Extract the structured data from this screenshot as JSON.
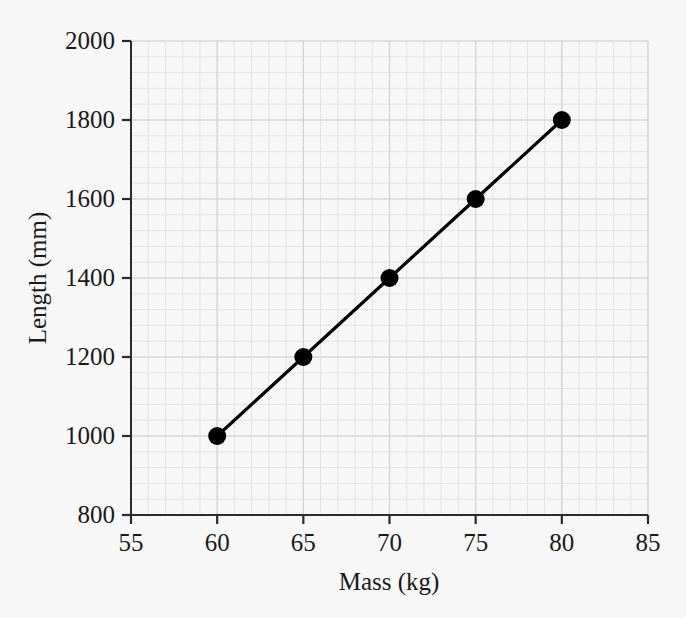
{
  "chart_data": {
    "type": "line",
    "title": "",
    "subtitle": "",
    "xlabel": "Mass (kg)",
    "ylabel": "Length (mm)",
    "xlim": [
      55,
      85
    ],
    "ylim": [
      800,
      2000
    ],
    "xticks": [
      55,
      60,
      65,
      70,
      75,
      80,
      85
    ],
    "yticks": [
      800,
      1000,
      1200,
      1400,
      1600,
      1800,
      2000
    ],
    "xtick_labels": [
      "55",
      "60",
      "65",
      "70",
      "75",
      "80",
      "85"
    ],
    "ytick_labels": [
      "800",
      "1000",
      "1200",
      "1400",
      "1600",
      "1800",
      "2000"
    ],
    "grid": true,
    "grid_style": "graph-paper",
    "legend": null,
    "legend_position": "none",
    "annotations": [],
    "series": [
      {
        "name": "Length vs Mass",
        "x": [
          60,
          65,
          70,
          75,
          80
        ],
        "values": [
          1000,
          1200,
          1400,
          1600,
          1800
        ],
        "marker": "filled-circle",
        "marker_color": "#000000",
        "line_color": "#000000"
      }
    ]
  },
  "colors": {
    "background": "#f7f7f7",
    "axis": "#2b2b2b",
    "data": "#000000",
    "grid_minor": "#e3e3e3",
    "grid_major": "#d2d2d2",
    "text": "#1a1a1a"
  }
}
